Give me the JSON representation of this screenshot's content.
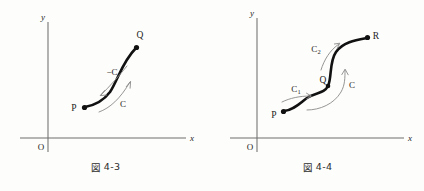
{
  "page": {
    "background": "#fdfdfb",
    "ink": "#111111",
    "axis_color": "#6f6f6f",
    "arrow_color": "#8a8a8a"
  },
  "figures": [
    {
      "id": "fig-4-3",
      "caption_kanji": "図",
      "caption_number": "4-3",
      "axes": {
        "x_label": "x",
        "y_label": "y",
        "origin_label": "O"
      },
      "points": [
        {
          "name": "P",
          "label": "P"
        },
        {
          "name": "Q",
          "label": "Q"
        }
      ],
      "curve_labels": [
        {
          "name": "minus-c",
          "label": "−C",
          "direction": "reverse"
        },
        {
          "name": "c",
          "label": "C",
          "direction": "forward"
        }
      ]
    },
    {
      "id": "fig-4-4",
      "caption_kanji": "図",
      "caption_number": "4-4",
      "axes": {
        "x_label": "x",
        "y_label": "y",
        "origin_label": "O"
      },
      "points": [
        {
          "name": "P",
          "label": "P"
        },
        {
          "name": "Q",
          "label": "Q"
        },
        {
          "name": "R",
          "label": "R"
        }
      ],
      "curve_labels": [
        {
          "name": "c1",
          "label": "C",
          "subscript": "1",
          "direction": "forward"
        },
        {
          "name": "c2",
          "label": "C",
          "subscript": "2",
          "direction": "forward"
        },
        {
          "name": "c",
          "label": "C",
          "subscript": "",
          "direction": "forward"
        }
      ]
    }
  ]
}
